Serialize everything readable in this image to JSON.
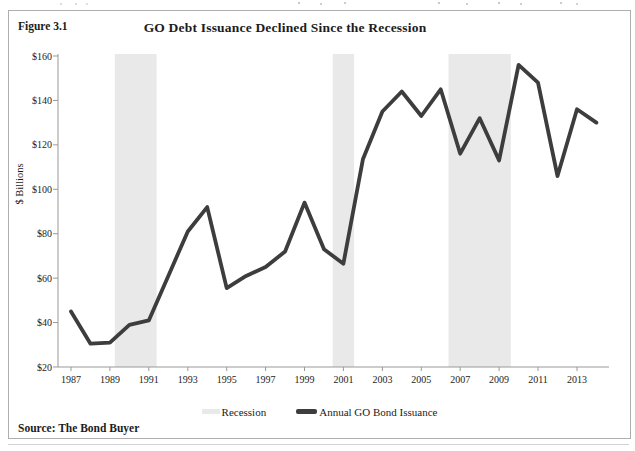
{
  "figure": {
    "label": "Figure 3.1",
    "title": "GO Debt Issuance Declined Since the Recession",
    "y_axis_title": "$ Billions",
    "source": "Source: The Bond Buyer"
  },
  "legend": [
    {
      "label": "Recession",
      "swatch_color": "#e9e9e9",
      "swatch_type": "band"
    },
    {
      "label": "Annual GO Bond Issuance",
      "swatch_color": "#3d3d3d",
      "swatch_type": "line"
    }
  ],
  "chart_data": {
    "type": "line",
    "title": "GO Debt Issuance Declined Since the Recession",
    "xlabel": "",
    "ylabel": "$ Billions",
    "ylim": [
      20,
      160
    ],
    "xlim": [
      1986.6,
      2014.8
    ],
    "grid": false,
    "legend_position": "bottom",
    "y_ticks": {
      "values": [
        160,
        140,
        120,
        100,
        80,
        60,
        40,
        20
      ],
      "labels": [
        "$160",
        "$140",
        "$120",
        "$100",
        "$80",
        "$60",
        "$40",
        "$20"
      ]
    },
    "x_ticks": {
      "years": [
        1987,
        1989,
        1991,
        1993,
        1995,
        1997,
        1999,
        2001,
        2003,
        2005,
        2007,
        2009,
        2011,
        2013
      ],
      "labels": [
        "1987",
        "1989",
        "1991",
        "1993",
        "1995",
        "1997",
        "1999",
        "2001",
        "2003",
        "2005",
        "2007",
        "2009",
        "2011",
        "2013"
      ]
    },
    "series": [
      {
        "name": "Annual GO Bond Issuance",
        "x": [
          1987,
          1988,
          1989,
          1990,
          1991,
          1992,
          1993,
          1994,
          1995,
          1996,
          1997,
          1998,
          1999,
          2000,
          2001,
          2002,
          2003,
          2004,
          2005,
          2006,
          2007,
          2008,
          2009,
          2010,
          2011,
          2012,
          2013,
          2014
        ],
        "values": [
          45,
          30.5,
          31,
          39,
          41,
          61,
          81,
          92,
          55.5,
          61,
          65,
          72,
          94,
          73,
          66.5,
          113.5,
          135,
          144,
          133,
          145,
          116,
          132,
          113,
          156,
          148,
          106,
          136,
          130
        ]
      }
    ],
    "recession_bands": [
      [
        1989.25,
        1991.4
      ],
      [
        2000.45,
        2001.55
      ],
      [
        2006.4,
        2009.6
      ]
    ],
    "colors": {
      "line": "#3d3d3d",
      "band": "#e9e9e9",
      "axis": "#999999"
    }
  }
}
